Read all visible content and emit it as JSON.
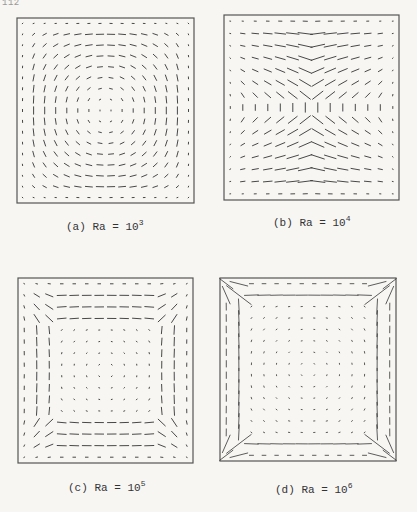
{
  "page": {
    "number": "112"
  },
  "figure": {
    "panels": [
      {
        "id": "a",
        "label": "(a)",
        "param": "Ra",
        "eq": "=",
        "base": "10",
        "exp": "3",
        "frame": {
          "x": 17,
          "y": 18,
          "w": 177,
          "h": 185
        },
        "caption_pos": {
          "x": 66,
          "y": 218
        },
        "grid": {
          "nx": 16,
          "ny": 17
        },
        "field": {
          "strength": 7,
          "wall_boost": 0,
          "core_scale": 1.0,
          "boundary_layer": 0.0,
          "overshoot": 0,
          "width": 0.9
        }
      },
      {
        "id": "b",
        "label": "(b)",
        "param": "Ra",
        "eq": "=",
        "base": "10",
        "exp": "4",
        "frame": {
          "x": 224,
          "y": 15,
          "w": 175,
          "h": 185
        },
        "caption_pos": {
          "x": 273,
          "y": 214
        },
        "grid": {
          "nx": 14,
          "ny": 15
        },
        "field": {
          "strength": 22,
          "wall_boost": 0.6,
          "core_scale": 0.8,
          "boundary_layer": 0.25,
          "overshoot": 0,
          "width": 0.9
        }
      },
      {
        "id": "c",
        "label": "(c)",
        "param": "Ra",
        "eq": "=",
        "base": "10",
        "exp": "5",
        "frame": {
          "x": 18,
          "y": 278,
          "w": 175,
          "h": 185
        },
        "caption_pos": {
          "x": 68,
          "y": 479
        },
        "grid": {
          "nx": 14,
          "ny": 16
        },
        "field": {
          "strength": 16,
          "wall_boost": 1.6,
          "core_scale": 0.35,
          "boundary_layer": 0.12,
          "overshoot": 0,
          "width": 0.9
        }
      },
      {
        "id": "d",
        "label": "(d)",
        "param": "Ra",
        "eq": "=",
        "base": "10",
        "exp": "6",
        "frame": {
          "x": 220,
          "y": 278,
          "w": 176,
          "h": 183
        },
        "caption_pos": {
          "x": 275,
          "y": 481
        },
        "grid": {
          "nx": 14,
          "ny": 16
        },
        "field": {
          "strength": 22,
          "wall_boost": 2.4,
          "core_scale": 0.25,
          "boundary_layer": 0.07,
          "overshoot": 14,
          "width": 0.8
        }
      }
    ]
  }
}
